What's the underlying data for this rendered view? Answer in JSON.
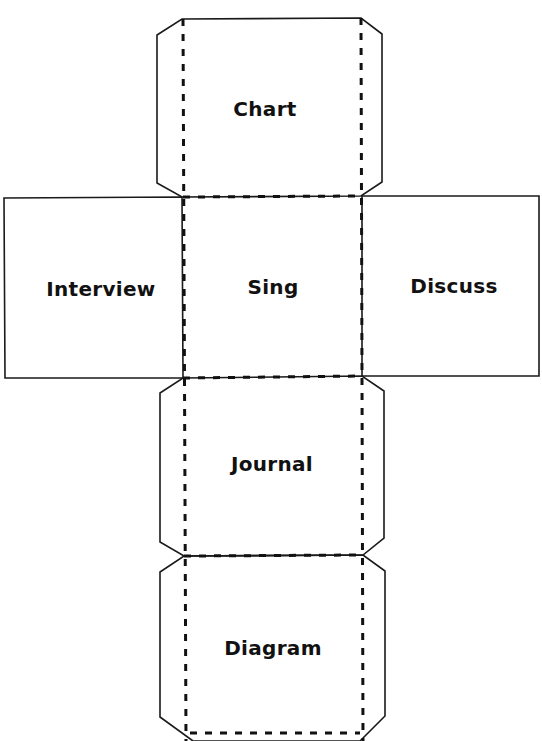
{
  "title": "Sample Die Net (cut off at top)",
  "faces": {
    "top": {
      "label": "Chart"
    },
    "left": {
      "label": "Interview"
    },
    "center": {
      "label": "Sing"
    },
    "right": {
      "label": "Discuss"
    },
    "lower": {
      "label": "Journal"
    },
    "bottom": {
      "label": "Diagram"
    }
  },
  "colors": {
    "line": "#1a1a1a",
    "text": "#111111",
    "background": "#ffffff"
  }
}
